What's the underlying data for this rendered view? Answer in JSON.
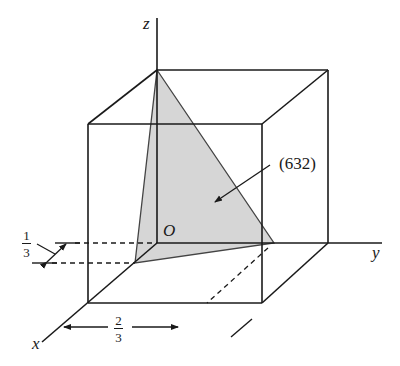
{
  "figure": {
    "axes": {
      "x_label": "x",
      "y_label": "y",
      "z_label": "z",
      "origin_label": "O"
    },
    "plane": {
      "label": "(632)",
      "fill_color": "#d6d6d6",
      "intercepts": {
        "x": "1/3",
        "y": "2/3",
        "z": "1"
      }
    },
    "dimensions": {
      "x_intercept": {
        "numerator": "1",
        "denominator": "3"
      },
      "y_intercept": {
        "numerator": "2",
        "denominator": "3"
      }
    },
    "colors": {
      "line": "#1a1a1a",
      "plane_fill": "#d6d6d6",
      "background": "#ffffff"
    }
  }
}
